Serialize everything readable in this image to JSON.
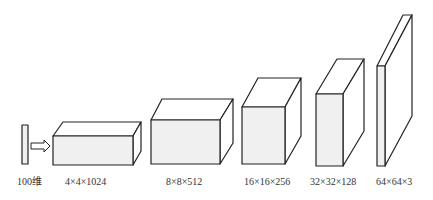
{
  "diagram": {
    "type": "generator-network-layers",
    "colors": {
      "stroke": "#222222",
      "front_fill": "#f0f0f0",
      "side_fill": "#ffffff",
      "label": "#333333"
    },
    "input": {
      "label": "100维"
    },
    "layers": [
      {
        "label": "4×4×1024"
      },
      {
        "label": "8×8×512"
      },
      {
        "label": "16×16×256"
      },
      {
        "label": "32×32×128"
      },
      {
        "label": "64×64×3"
      }
    ]
  }
}
